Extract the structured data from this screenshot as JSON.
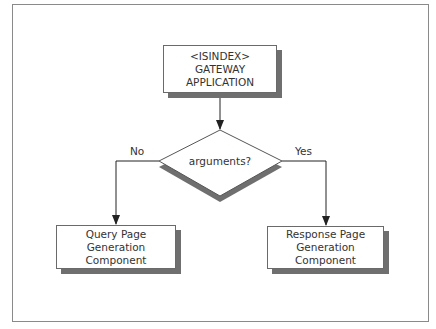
{
  "diagram": {
    "type": "flowchart",
    "nodes": {
      "start": {
        "lines": [
          "<ISINDEX>",
          "GATEWAY",
          "APPLICATION"
        ]
      },
      "decision": {
        "text": "arguments?"
      },
      "no_branch": {
        "lines": [
          "Query Page",
          "Generation Component"
        ]
      },
      "yes_branch": {
        "lines": [
          "Response Page",
          "Generation Component"
        ]
      }
    },
    "edges": {
      "no_label": "No",
      "yes_label": "Yes"
    },
    "colors": {
      "stroke": "#333333",
      "shadow": "#6f6f6f",
      "frame": "#8a8a8a",
      "fill": "#ffffff"
    }
  }
}
